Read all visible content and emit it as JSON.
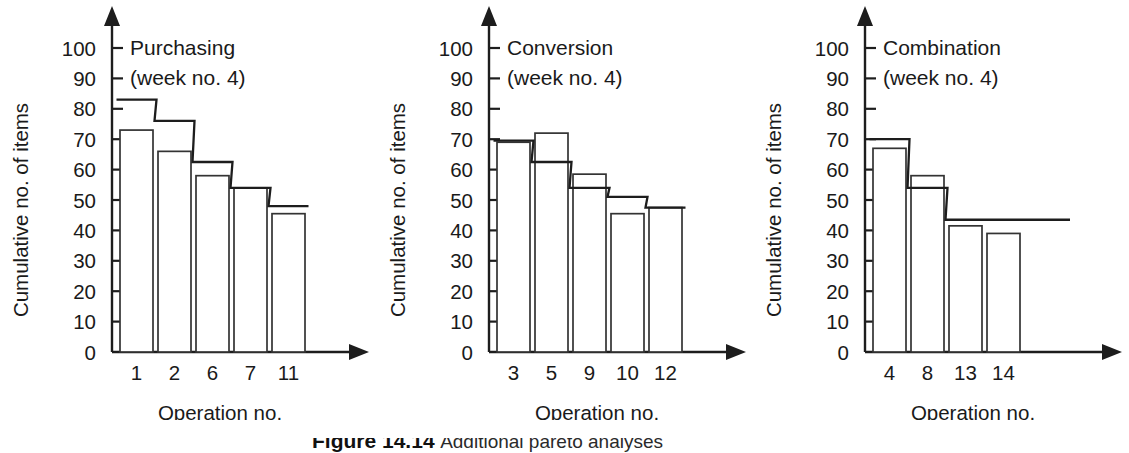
{
  "figure": {
    "caption_label": "Figure 14.14",
    "caption_text": "Additional pareto analyses",
    "background": "#ffffff",
    "ink_color": "#1d1d1d"
  },
  "chart_data": [
    {
      "type": "bar",
      "title": "Purchasing",
      "subtitle": "(week no. 4)",
      "xlabel": "Operation no.",
      "ylabel": "Cumulative no. of items",
      "categories": [
        "1",
        "2",
        "6",
        "7",
        "11"
      ],
      "values": [
        73,
        66,
        58,
        54,
        45.5
      ],
      "step_values": [
        83,
        76,
        62.5,
        54,
        48
      ],
      "ylim": [
        0,
        100
      ],
      "yticks": [
        0,
        10,
        20,
        30,
        40,
        50,
        60,
        70,
        80,
        90,
        100
      ],
      "ytick_labels": [
        "0",
        "10",
        "20",
        "30",
        "40",
        "50",
        "60",
        "70",
        "80",
        "90",
        "100"
      ],
      "grid": false,
      "legend": "none",
      "step_extends_past_last_bar": false
    },
    {
      "type": "bar",
      "title": "Conversion",
      "subtitle": "(week no. 4)",
      "xlabel": "Operation no.",
      "ylabel": "Cumulative no. of items",
      "categories": [
        "3",
        "5",
        "9",
        "10",
        "12"
      ],
      "values": [
        69,
        72,
        58.5,
        45.5,
        47.5
      ],
      "step_values": [
        69.5,
        62.5,
        54,
        51,
        47.5
      ],
      "ylim": [
        0,
        100
      ],
      "yticks": [
        0,
        10,
        20,
        30,
        40,
        50,
        60,
        70,
        80,
        90,
        100
      ],
      "ytick_labels": [
        "0",
        "10",
        "20",
        "30",
        "40",
        "50",
        "60",
        "70",
        "80",
        "90",
        "100"
      ],
      "grid": false,
      "legend": "none",
      "step_extends_past_last_bar": false
    },
    {
      "type": "bar",
      "title": "Combination",
      "subtitle": "(week no. 4)",
      "xlabel": "Operation no.",
      "ylabel": "Cumulative no. of items",
      "categories": [
        "4",
        "8",
        "13",
        "14"
      ],
      "values": [
        67,
        58,
        41.5,
        39
      ],
      "step_values": [
        70,
        54,
        43.5,
        43.5
      ],
      "ylim": [
        0,
        100
      ],
      "yticks": [
        0,
        10,
        20,
        30,
        40,
        50,
        60,
        70,
        80,
        90,
        100
      ],
      "ytick_labels": [
        "0",
        "10",
        "20",
        "30",
        "40",
        "50",
        "60",
        "70",
        "80",
        "90",
        "100"
      ],
      "grid": false,
      "legend": "none",
      "step_extends_past_last_bar": true
    }
  ]
}
